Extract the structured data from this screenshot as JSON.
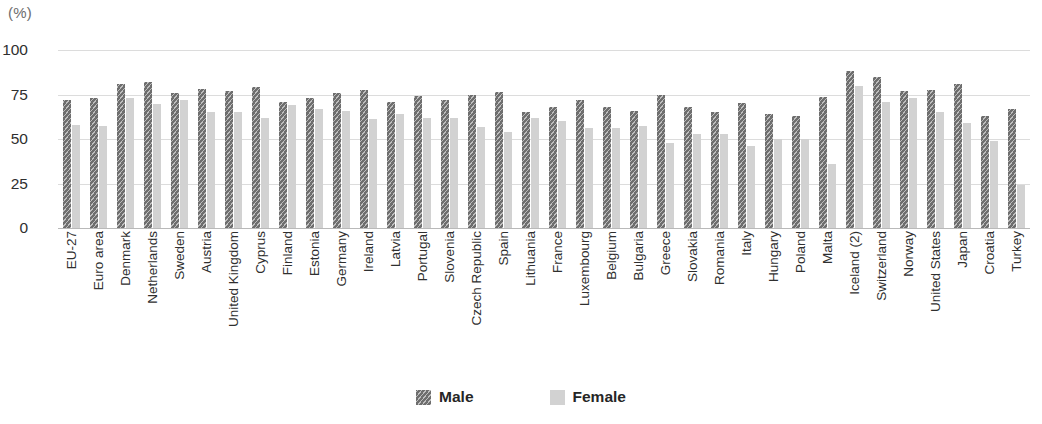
{
  "chart_data": {
    "type": "bar",
    "title": "",
    "subtitle": "",
    "xlabel": "",
    "ylabel": "",
    "unit_caption": "(%)",
    "ylim": [
      0,
      100
    ],
    "yticks": [
      100,
      75,
      50,
      25,
      0
    ],
    "grid": true,
    "legend_position": "bottom-center",
    "categories": [
      "EU-27",
      "Euro area",
      "Denmark",
      "Netherlands",
      "Sweden",
      "Austria",
      "United Kingdom",
      "Cyprus",
      "Finland",
      "Estonia",
      "Germany",
      "Ireland",
      "Latvia",
      "Portugal",
      "Slovenia",
      "Czech Republic",
      "Spain",
      "Lithuania",
      "France",
      "Luxembourg",
      "Belgium",
      "Bulgaria",
      "Greece",
      "Slovakia",
      "Romania",
      "Italy",
      "Hungary",
      "Poland",
      "Malta",
      "Iceland (2)",
      "Switzerland",
      "Norway",
      "United States",
      "Japan",
      "Croatia",
      "Turkey"
    ],
    "series": [
      {
        "name": "Male",
        "color": "#6e6e6e",
        "pattern": "diagonal-hatch",
        "values": [
          72,
          73,
          81,
          82,
          76,
          78,
          77,
          79.5,
          71,
          73,
          76,
          77.5,
          71,
          74,
          72,
          75,
          76.5,
          65,
          68,
          72,
          68,
          66,
          75,
          68,
          65,
          70,
          64,
          63,
          73.5,
          88,
          85,
          77,
          77.5,
          81,
          63,
          67
        ]
      },
      {
        "name": "Female",
        "color": "#d2d2d2",
        "pattern": "solid",
        "values": [
          58,
          57.5,
          73,
          69.5,
          72,
          65,
          65,
          62,
          69,
          67,
          66,
          61,
          64,
          62,
          62,
          57,
          54,
          62,
          60,
          56,
          56,
          57.5,
          48,
          53,
          53,
          46,
          50,
          50,
          36,
          80,
          71,
          73,
          65,
          59,
          49,
          24
        ]
      }
    ]
  },
  "legend": {
    "items": [
      {
        "label": "Male",
        "swatch": "hatched-dark-gray-swatch"
      },
      {
        "label": "Female",
        "swatch": "solid-light-gray-swatch"
      }
    ]
  }
}
